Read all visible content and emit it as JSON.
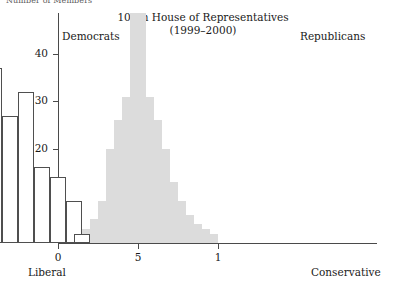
{
  "figure": {
    "top_caption": "Number of Members",
    "title_line1": "106th House of Representatives",
    "title_line2": "(1999–2000)",
    "group_label_left": "Democrats",
    "group_label_right": "Republicans",
    "axis_end_label_left": "Liberal",
    "axis_end_label_right": "Conservative"
  },
  "chart_data": {
    "type": "bar",
    "title": "106th House of Representatives (1999–2000)",
    "subtitle": "(1999–2000)",
    "xlabel": "",
    "ylabel": "Number of Members",
    "xlim": [
      -1.05,
      1.0
    ],
    "ylim": [
      0,
      45
    ],
    "grid": false,
    "legend": false,
    "bin_width": 0.1,
    "x_ticks": [
      -1,
      -0.5,
      0,
      0.5,
      1
    ],
    "x_tick_labels": [
      "-1",
      "-.5",
      "0",
      "5",
      "1"
    ],
    "y_ticks": [
      10,
      20,
      30,
      40
    ],
    "y_tick_labels": [
      "10",
      "20",
      "30",
      "40"
    ],
    "axis_anchor_labels": {
      "left": "Liberal",
      "right": "Conservative"
    },
    "series": [
      {
        "name": "Democrats",
        "style": "outlined-white",
        "color": "#ffffff",
        "edge_color": "#4f4f4f",
        "bins": [
          -1.0,
          -0.9,
          -0.75,
          -0.65,
          -0.55,
          -0.45,
          -0.35,
          -0.25,
          -0.15,
          -0.05,
          0.05,
          0.1
        ],
        "values": [
          3,
          3,
          12,
          26,
          25,
          37,
          27,
          32,
          16,
          14,
          9,
          2
        ]
      },
      {
        "name": "Republicans",
        "style": "filled-gray",
        "color": "#dcdcdc",
        "edge_color": "#dcdcdc",
        "bins": [
          0.05,
          0.15,
          0.2,
          0.25,
          0.3,
          0.35,
          0.4,
          0.45,
          0.5,
          0.55,
          0.6,
          0.65,
          0.7,
          0.75,
          0.8,
          0.85,
          0.9
        ],
        "values": [
          1,
          3,
          5,
          9,
          20,
          26,
          31,
          57,
          31,
          26,
          20,
          13,
          9,
          6,
          4,
          3,
          2
        ],
        "note": "tallest bin is clipped by the top of the plotting frame"
      }
    ]
  }
}
